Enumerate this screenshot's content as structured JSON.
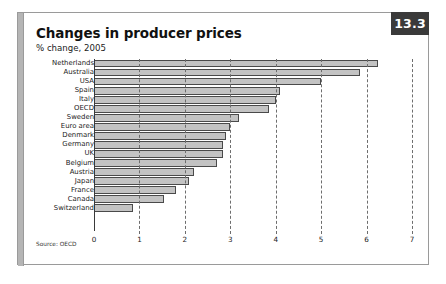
{
  "panel": {
    "chart_number": "13.3",
    "title": "Changes in producer prices",
    "subtitle": "% change, 2005",
    "source": "Source: OECD"
  },
  "chart_data": {
    "type": "bar",
    "orientation": "horizontal",
    "title": "Changes in producer prices",
    "subtitle": "% change, 2005",
    "xlabel": "",
    "ylabel": "",
    "xlim": [
      0,
      7
    ],
    "xticks": [
      0,
      1,
      2,
      3,
      4,
      5,
      6,
      7
    ],
    "xtick_labels": [
      "0",
      "1",
      "2",
      "3",
      "4",
      "5",
      "6",
      "7"
    ],
    "grid": true,
    "legend": "none",
    "source": "Source: OECD",
    "bar_color": "#c3c3c3",
    "bar_edge_color": "#4a4a4a",
    "categories": [
      "Netherlands",
      "Australia",
      "USA",
      "Spain",
      "Italy",
      "OECD",
      "Sweden",
      "Euro area",
      "Denmark",
      "Germany",
      "UK",
      "Belgium",
      "Austria",
      "Japan",
      "France",
      "Canada",
      "Switzerland"
    ],
    "values": [
      6.25,
      5.85,
      5.0,
      4.1,
      4.0,
      3.85,
      3.2,
      3.0,
      2.9,
      2.85,
      2.85,
      2.7,
      2.2,
      2.1,
      1.8,
      1.55,
      0.85
    ]
  }
}
